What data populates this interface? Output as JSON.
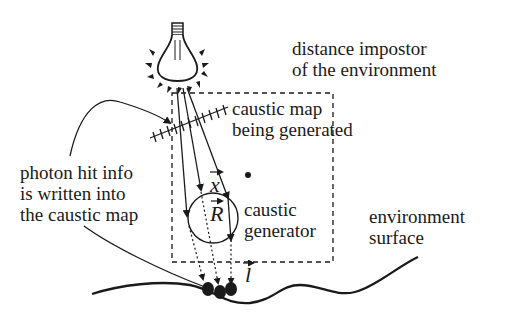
{
  "labels": {
    "impostor_line1": "distance impostor",
    "impostor_line2": "of the environment",
    "caustic_map_line1": "caustic map",
    "caustic_map_line2": "being generated",
    "photon_line1": "photon hit info",
    "photon_line2": "is written into",
    "photon_line3": "the  caustic map",
    "generator_line1": "caustic",
    "generator_line2": "generator",
    "surface_line1": "environment",
    "surface_line2": "surface"
  },
  "symbols": {
    "x": "x",
    "R": "R",
    "l": "l"
  },
  "colors": {
    "ink": "#1a1a1a",
    "background": "#ffffff"
  }
}
